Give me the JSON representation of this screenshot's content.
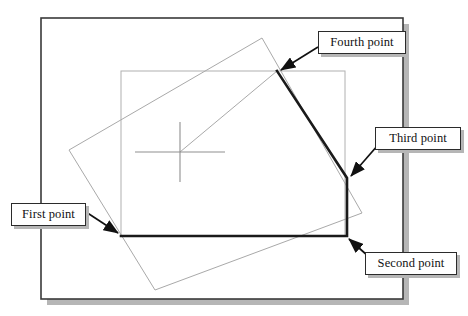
{
  "figure": {
    "type": "cad-polyline-construction"
  },
  "callouts": [
    {
      "id": "fourth",
      "label": "Fourth point",
      "target_x": 277,
      "target_y": 71
    },
    {
      "id": "third",
      "label": "Third point",
      "target_x": 347,
      "target_y": 178
    },
    {
      "id": "first",
      "label": "First point",
      "target_x": 121,
      "target_y": 236
    },
    {
      "id": "second",
      "label": "Second point",
      "target_x": 347,
      "target_y": 236
    }
  ],
  "geometry": {
    "window_frame": {
      "x": 41,
      "y": 18,
      "width": 362,
      "height": 281
    },
    "shadow_offset": 6,
    "inner_rectangle": {
      "x": 121,
      "y": 71,
      "width": 224,
      "height": 165
    },
    "rotated_rectangle_points": "69,150 262,38 362,213 155,290",
    "polyline_points": "121,236 347,236 347,178 277,71",
    "rubber_band": {
      "x1": 180,
      "y1": 152,
      "x2": 277,
      "y2": 71
    },
    "crosshair": {
      "cx": 180,
      "cy": 152,
      "half_width": 45,
      "half_height": 30
    }
  },
  "colors": {
    "frame_stroke": "#3a3a3a",
    "shadow": "#b6b6b6",
    "thin_geometry": "#a9a9a9",
    "polyline": "#1a1a1a",
    "callout_border": "#2b2b2b",
    "callout_background": "#ffffff",
    "arrow": "#111111"
  }
}
